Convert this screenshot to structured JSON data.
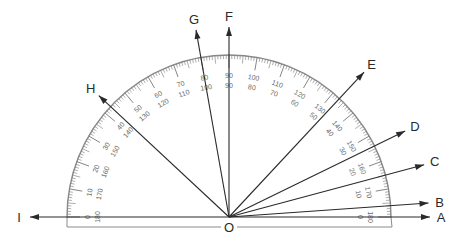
{
  "diagram": {
    "type": "protractor-angle-diagram",
    "origin": {
      "label": "O",
      "x": 229,
      "y": 217
    },
    "protractor": {
      "outer_radius": 162,
      "base_y": 227,
      "base_left_x": 67,
      "base_right_x": 392,
      "outer_scale_labels": [
        "0",
        "10",
        "20",
        "30",
        "40",
        "50",
        "60",
        "70",
        "80",
        "90",
        "100",
        "110",
        "120",
        "130",
        "140",
        "150",
        "160",
        "170",
        "180"
      ],
      "inner_scale_labels": [
        "180",
        "170",
        "160",
        "150",
        "140",
        "130",
        "120",
        "110",
        "100",
        "90",
        "80",
        "70",
        "60",
        "50",
        "40",
        "30",
        "20",
        "10",
        "0"
      ],
      "colors": {
        "arc": "#8a8a8a",
        "ticks": "#777777",
        "numbers": "#6a6a6a"
      }
    },
    "rays": [
      {
        "label": "A",
        "angle_deg": 0,
        "length": 201
      },
      {
        "label": "B",
        "angle_deg": 4,
        "length": 200
      },
      {
        "label": "C",
        "angle_deg": 15,
        "length": 202
      },
      {
        "label": "D",
        "angle_deg": 26,
        "length": 196
      },
      {
        "label": "E",
        "angle_deg": 47,
        "length": 198
      },
      {
        "label": "F",
        "angle_deg": 90,
        "length": 190
      },
      {
        "label": "G",
        "angle_deg": 100,
        "length": 190
      },
      {
        "label": "H",
        "angle_deg": 137,
        "length": 178
      },
      {
        "label": "I",
        "angle_deg": 180,
        "length": 199
      }
    ],
    "colors": {
      "ray": "#2a2a2a",
      "label": "#2a2a2a",
      "background": "#ffffff"
    }
  }
}
